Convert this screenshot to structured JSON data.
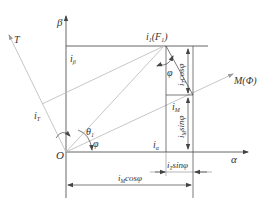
{
  "diagram": {
    "type": "phasor-vector-diagram",
    "axes": {
      "alpha": "α",
      "beta": "β",
      "origin": "O"
    },
    "vectors": {
      "T": "T",
      "M": "M(Φ)",
      "i1": "i",
      "i1_sub": "1",
      "i1_paren": "(F",
      "i1_paren_sub": "1",
      "i1_close": ")"
    },
    "labels": {
      "i_beta": "i",
      "i_beta_sub": "β",
      "i_T": "i",
      "i_T_sub": "T",
      "i_alpha": "i",
      "i_alpha_sub": "α",
      "i_M": "i",
      "i_M_sub": "M",
      "theta1": "θ",
      "theta1_sub": "1",
      "phi_origin": "φ",
      "phi_top": "φ",
      "iT_cos": "cosφ",
      "iT_cos_prefix": "i",
      "iT_cos_sub": "T",
      "iM_sin": "sinφ",
      "iM_sin_prefix": "i",
      "iM_sin_sub": "M",
      "iT_sin": "sinφ",
      "iT_sin_prefix": "i",
      "iT_sin_sub": "T",
      "iM_cos": "cosφ",
      "iM_cos_prefix": "i",
      "iM_cos_sub": "M"
    }
  }
}
